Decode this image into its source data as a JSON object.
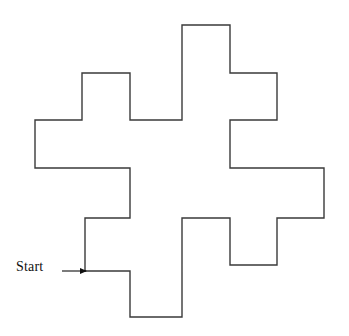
{
  "figure": {
    "background_color": "#ffffff",
    "stroke_color": "#3a3a3a",
    "stroke_width": 1.4,
    "annotation": {
      "start_label": "Start",
      "arrow_name": "start-arrow",
      "arrow_from_x": 62,
      "arrow_to_x": 86,
      "arrow_y": 271
    },
    "grid": {
      "x_ticks": [
        35,
        82,
        130,
        182,
        230,
        277,
        324
      ],
      "y_ticks": [
        25,
        73,
        120,
        168,
        218,
        265,
        317
      ],
      "unit": 47.5,
      "visible": false
    },
    "path": {
      "closed": true,
      "start_point": [
        85,
        271
      ],
      "points": [
        [
          85,
          271
        ],
        [
          85,
          218
        ],
        [
          130,
          218
        ],
        [
          130,
          168
        ],
        [
          35,
          168
        ],
        [
          35,
          120
        ],
        [
          82,
          120
        ],
        [
          82,
          73
        ],
        [
          130,
          73
        ],
        [
          130,
          120
        ],
        [
          182,
          120
        ],
        [
          182,
          25
        ],
        [
          230,
          25
        ],
        [
          230,
          73
        ],
        [
          277,
          73
        ],
        [
          277,
          120
        ],
        [
          230,
          120
        ],
        [
          230,
          168
        ],
        [
          324,
          168
        ],
        [
          324,
          218
        ],
        [
          277,
          218
        ],
        [
          277,
          265
        ],
        [
          230,
          265
        ],
        [
          230,
          218
        ],
        [
          182,
          218
        ],
        [
          182,
          317
        ],
        [
          130,
          317
        ],
        [
          130,
          271
        ]
      ]
    }
  }
}
